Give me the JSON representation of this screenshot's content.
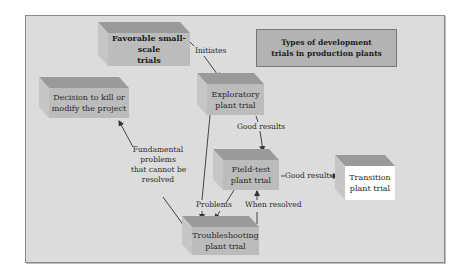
{
  "diagram": {
    "title": "Types of development trials in production plants",
    "title_lines": [
      "Types of development",
      "trials in production plants"
    ],
    "colors": {
      "panel_bg": "#dcdcdc",
      "panel_border": "#8a8a8a",
      "box_front": "#bcbcbc",
      "box_top": "#9a9a9a",
      "box_side": "#c6c6c6",
      "title_box_fill": "#b3b3b3",
      "transition_front": "#ffffff",
      "arrow": "#333333"
    },
    "nodes": {
      "favorable": {
        "line1": "Favorable small-scale",
        "line2": "trials"
      },
      "decision": {
        "line1": "Decision to kill or",
        "line2": "modify the project"
      },
      "exploratory": {
        "line1": "Exploratory",
        "line2": "plant trial"
      },
      "fieldtest": {
        "line1": "Field-test",
        "line2": "plant trial"
      },
      "transition": {
        "line1": "Transition",
        "line2": "plant trial"
      },
      "troubleshooting": {
        "line1": "Troubleshooting",
        "line2": "plant trial"
      }
    },
    "edges": {
      "initiates": "Initiates",
      "good_results_1": "Good results",
      "good_results_2": "Good results",
      "problems": "Problems",
      "when_resolved": "When resolved",
      "fundamental": {
        "line1": "Fundamental",
        "line2": "problems",
        "line3": "that cannot be",
        "line4": "resolved"
      }
    }
  }
}
